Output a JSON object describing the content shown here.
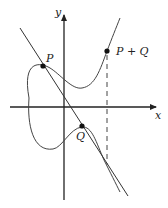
{
  "diagram": {
    "axes": {
      "x_label": "x",
      "y_label": "y"
    },
    "points": [
      {
        "name": "P",
        "label": "P"
      },
      {
        "name": "Q",
        "label": "Q"
      },
      {
        "name": "P+Q",
        "label": "P + Q"
      }
    ],
    "colors": {
      "stroke": "#333333",
      "background": "#ffffff"
    }
  }
}
